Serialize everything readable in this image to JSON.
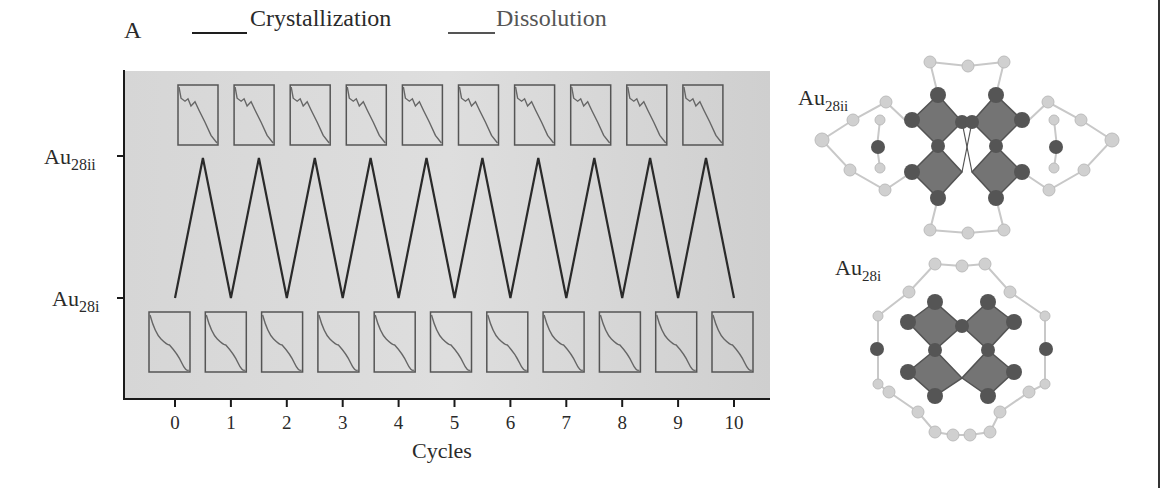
{
  "figure": {
    "panel_letter": "A",
    "right_border_color": "#333333"
  },
  "chart_data": {
    "type": "line",
    "title": "",
    "panel": "A",
    "xlabel": "Cycles",
    "ylabel": "",
    "x_ticks": [
      "0",
      "1",
      "2",
      "3",
      "4",
      "5",
      "6",
      "7",
      "8",
      "9",
      "10"
    ],
    "y_ticks": [
      {
        "label": "Au",
        "sub": "28i",
        "level": 0
      },
      {
        "label": "Au",
        "sub": "28ii",
        "level": 1
      }
    ],
    "legend": [
      {
        "name": "Crystallization",
        "color": "#1e1e1e"
      },
      {
        "name": "Dissolution",
        "color": "#555555"
      }
    ],
    "legend_position": "top",
    "grid": false,
    "background": "#d9d9d9",
    "xlim": [
      0,
      10
    ],
    "ylim": [
      0,
      1
    ],
    "series": [
      {
        "name": "Crystallization/Dissolution cycle",
        "x": [
          0,
          0.5,
          1,
          1.5,
          2,
          2.5,
          3,
          3.5,
          4,
          4.5,
          5,
          5.5,
          6,
          6.5,
          7,
          7.5,
          8,
          8.5,
          9,
          9.5,
          10
        ],
        "y": [
          0,
          1,
          0,
          1,
          0,
          1,
          0,
          1,
          0,
          1,
          0,
          1,
          0,
          1,
          0,
          1,
          0,
          1,
          0,
          1,
          0
        ]
      }
    ],
    "insets": {
      "top_count": 10,
      "top_state": "Au28ii absorption spectrum",
      "bottom_count": 11,
      "bottom_state": "Au28i absorption spectrum"
    }
  },
  "structures": [
    {
      "label": "Au",
      "sub": "28ii",
      "position": "top"
    },
    {
      "label": "Au",
      "sub": "28i",
      "position": "bottom"
    }
  ]
}
